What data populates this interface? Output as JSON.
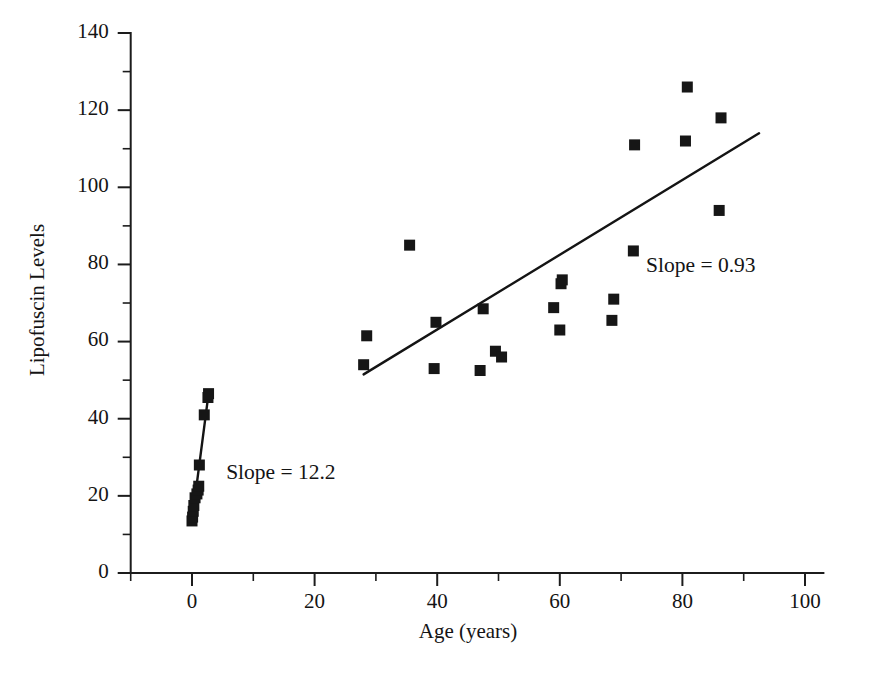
{
  "chart_data": {
    "type": "scatter",
    "title": "",
    "xlabel": "Age (years)",
    "ylabel": "Lipofuscin Levels",
    "xlim": [
      -10,
      103
    ],
    "ylim": [
      0,
      140
    ],
    "xticks": [
      0,
      20,
      40,
      60,
      80,
      100
    ],
    "xtick_labels": [
      "0",
      "20",
      "40",
      "60",
      "80",
      "100"
    ],
    "xminor_ticks": [
      -10,
      10,
      30,
      50,
      70,
      90
    ],
    "yticks": [
      0,
      20,
      40,
      60,
      80,
      100,
      120,
      140
    ],
    "ytick_labels": [
      "0",
      "20",
      "40",
      "60",
      "80",
      "100",
      "120",
      "140"
    ],
    "yminor_ticks": [
      10,
      30,
      50,
      70,
      90,
      110,
      130
    ],
    "grid": false,
    "legend": false,
    "marker": "square",
    "marker_size": 11,
    "series": [
      {
        "name": "young-cluster",
        "points": [
          [
            0.0,
            13.5
          ],
          [
            0.1,
            14.5
          ],
          [
            0.2,
            16.0
          ],
          [
            0.3,
            17.5
          ],
          [
            0.5,
            19.5
          ],
          [
            0.8,
            20.5
          ],
          [
            1.0,
            21.5
          ],
          [
            1.1,
            22.5
          ],
          [
            1.2,
            28.0
          ],
          [
            2.0,
            41.0
          ],
          [
            2.6,
            45.5
          ],
          [
            2.7,
            46.5
          ]
        ]
      },
      {
        "name": "adult-cluster",
        "points": [
          [
            28.0,
            54.0
          ],
          [
            28.5,
            61.5
          ],
          [
            35.5,
            85.0
          ],
          [
            39.5,
            53.0
          ],
          [
            39.8,
            65.0
          ],
          [
            47.0,
            52.5
          ],
          [
            47.5,
            68.5
          ],
          [
            49.5,
            57.5
          ],
          [
            50.5,
            56.0
          ],
          [
            59.0,
            68.8
          ],
          [
            60.0,
            63.0
          ],
          [
            60.2,
            75.0
          ],
          [
            60.4,
            76.0
          ],
          [
            68.5,
            65.5
          ],
          [
            68.8,
            71.0
          ],
          [
            72.0,
            83.5
          ],
          [
            72.2,
            111.0
          ],
          [
            80.5,
            112.0
          ],
          [
            80.8,
            126.0
          ],
          [
            86.0,
            94.0
          ],
          [
            86.3,
            118.0
          ]
        ]
      }
    ],
    "fit_lines": [
      {
        "name": "young-fit",
        "slope": 12.2,
        "x_start": 0.2,
        "y_start": 16.0,
        "x_end": 2.7,
        "y_end": 46.5
      },
      {
        "name": "adult-fit",
        "slope": 0.93,
        "x_start": 28.0,
        "y_start": 51.5,
        "x_end": 92.5,
        "y_end": 114.0
      }
    ],
    "annotations": [
      {
        "name": "slope-young-label",
        "text": "Slope = 12.2",
        "x": 14.5,
        "y": 24.5
      },
      {
        "name": "slope-adult-label",
        "text": "Slope = 0.93",
        "x": 83.0,
        "y": 78.0
      }
    ]
  }
}
